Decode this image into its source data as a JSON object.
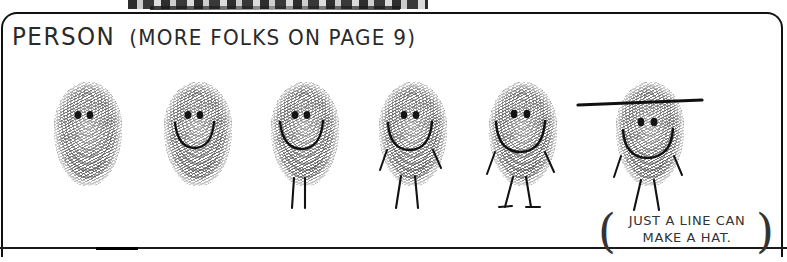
{
  "page": {
    "background_color": "#ffffff",
    "ink_color": "#2a2a2a",
    "width": 787,
    "height": 262
  },
  "panel": {
    "title_main": "PERSON",
    "title_note": "(MORE FOLKS ON PAGE 9)",
    "frame_color": "#111111"
  },
  "caption": {
    "line1": "JUST A LINE CAN",
    "line2": "MAKE A HAT.",
    "paren_left": "(",
    "paren_right": ")"
  },
  "figures": [
    {
      "index": 1,
      "label": "fingerprint-face-eyes-only",
      "x": 54,
      "has_eyes": true,
      "has_mouth": false,
      "has_legs": false,
      "has_arms": false,
      "has_feet": false,
      "has_hat": false
    },
    {
      "index": 2,
      "label": "fingerprint-face-smile",
      "x": 164,
      "has_eyes": true,
      "has_mouth": true,
      "has_legs": false,
      "has_arms": false,
      "has_feet": false,
      "has_hat": false
    },
    {
      "index": 3,
      "label": "fingerprint-face-smile-legs",
      "x": 271,
      "has_eyes": true,
      "has_mouth": true,
      "has_legs": true,
      "has_arms": false,
      "has_feet": false,
      "has_hat": false
    },
    {
      "index": 4,
      "label": "fingerprint-face-smile-legs-arms",
      "x": 379,
      "has_eyes": true,
      "has_mouth": true,
      "has_legs": true,
      "has_arms": true,
      "has_feet": false,
      "has_hat": false
    },
    {
      "index": 5,
      "label": "fingerprint-face-smile-legs-arms-feet",
      "x": 489,
      "has_eyes": true,
      "has_mouth": true,
      "has_legs": true,
      "has_arms": true,
      "has_feet": true,
      "has_hat": false
    },
    {
      "index": 6,
      "label": "fingerprint-face-with-hat",
      "x": 616,
      "has_eyes": true,
      "has_mouth": true,
      "has_legs": true,
      "has_arms": true,
      "has_feet": true,
      "has_hat": true
    }
  ]
}
